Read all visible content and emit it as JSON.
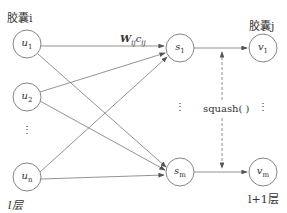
{
  "diagram": {
    "left_layer": {
      "header": "胶囊i",
      "footer": "l层",
      "nodes": [
        {
          "id": "u1",
          "var": "u",
          "sub": "1"
        },
        {
          "id": "u2",
          "var": "u",
          "sub": "2"
        },
        {
          "id": "un",
          "var": "u",
          "sub": "n"
        }
      ],
      "ellipsis": "⋮"
    },
    "middle_layer": {
      "nodes": [
        {
          "id": "s1",
          "var": "s",
          "sub": "1"
        },
        {
          "id": "sm",
          "var": "s",
          "sub": "m"
        }
      ],
      "ellipsis": "⋮"
    },
    "right_layer": {
      "header": "胶囊j",
      "footer": "l+1层",
      "nodes": [
        {
          "id": "v1",
          "var": "v",
          "sub": "1"
        },
        {
          "id": "vm",
          "var": "v",
          "sub": "m"
        }
      ],
      "ellipsis": "⋮"
    },
    "edge_label": {
      "main": "W",
      "sub1": "ij",
      "main2": "c",
      "sub2": "ij"
    },
    "function_label": "squash( )",
    "colors": {
      "stroke": "#666666",
      "text": "#333333",
      "background": "#ffffff"
    }
  }
}
